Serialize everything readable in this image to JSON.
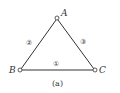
{
  "diagram": {
    "caption": "(a)",
    "nodes": [
      {
        "id": "A",
        "label": "A"
      },
      {
        "id": "B",
        "label": "B"
      },
      {
        "id": "C",
        "label": "C"
      }
    ],
    "members": [
      {
        "id": "1",
        "label": "①",
        "from": "B",
        "to": "C"
      },
      {
        "id": "2",
        "label": "②",
        "from": "B",
        "to": "A"
      },
      {
        "id": "3",
        "label": "③",
        "from": "A",
        "to": "C"
      }
    ],
    "colors": {
      "line": "#333333",
      "background": "#ffffff"
    }
  }
}
